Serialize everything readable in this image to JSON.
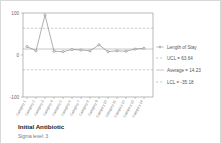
{
  "chart_data": {
    "type": "line",
    "title": "Initial Antibiotic",
    "subtitle": "Sigma level: 3",
    "xlabel": "",
    "ylabel": "",
    "ylim": [
      -100,
      100
    ],
    "yticks": [
      100,
      0,
      -100
    ],
    "ytick_labels": [
      "100",
      "0",
      "-100"
    ],
    "grid": false,
    "legend_position": "right",
    "series_name": "Length of Stay",
    "categories": [
      "Category 1",
      "Category 2",
      "Category 3",
      "Category 4",
      "Category 5",
      "Category 6",
      "Category 7",
      "Category 8",
      "Category 9",
      "Category 10",
      "Category 11",
      "Category 12",
      "Category 13",
      "Category 14"
    ],
    "values": [
      20,
      10,
      95,
      9,
      8,
      13,
      12,
      10,
      24,
      8,
      10,
      9,
      14,
      16
    ],
    "center_line": 14.23,
    "upper_control_limit": 63.64,
    "lower_control_limit": -35.18
  },
  "legend": {
    "series_label": "Length of Stay",
    "ucl_label": "UCL = 63.64",
    "average_label": "Average = 14.23",
    "lcl_label": "LCL = -35.18"
  },
  "axis": {
    "y_top": "100",
    "y_mid": "0",
    "y_bottom": "-100"
  },
  "colors": {
    "series": "#8d8d8d",
    "control_limit": "#9aa3b0",
    "center": "#9a9a9a",
    "axis": "#8a8a8a",
    "border": "#d8d8d8",
    "title": "#222222",
    "subtitle": "#777777"
  }
}
